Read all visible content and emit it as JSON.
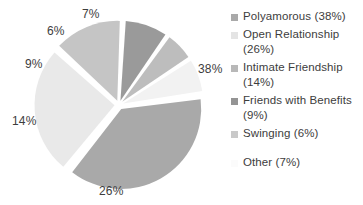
{
  "chart_data": {
    "type": "pie",
    "title": "",
    "subtitle": "",
    "xlabel": "",
    "ylabel": "",
    "legend_position": "right",
    "grid": false,
    "categories": [
      "Polyamorous",
      "Open Relationship",
      "Intimate Friendship",
      "Friends with Benefits",
      "Swinging",
      "Other"
    ],
    "values": [
      38,
      26,
      14,
      9,
      6,
      7
    ],
    "value_unit": "%",
    "slice_labels": [
      "38%",
      "26%",
      "14%",
      "9%",
      "6%",
      "7%"
    ],
    "slice_colors": [
      "#a9a9a9",
      "#e9e9e9",
      "#c5c5c5",
      "#9a9a9a",
      "#bdbdbd",
      "#f2f2f2"
    ],
    "exploded": true,
    "start_angle_deg": -8,
    "legend_entries": [
      "Polyamorous (38%)",
      "Open Relationship (26%)",
      "Intimate Friendship (14%)",
      "Friends with Benefits (9%)",
      "Swinging (6%)",
      "Other (7%)"
    ]
  },
  "pie": {
    "labels": [
      {
        "text": "38%",
        "left": 198,
        "top": 62
      },
      {
        "text": "26%",
        "left": 99,
        "top": 184
      },
      {
        "text": "14%",
        "left": 12,
        "top": 114
      },
      {
        "text": "9%",
        "left": 25,
        "top": 57
      },
      {
        "text": "6%",
        "left": 47,
        "top": 24
      },
      {
        "text": "7%",
        "left": 82,
        "top": 7
      }
    ]
  },
  "legend": {
    "items": [
      {
        "label": "Polyamorous (38%)",
        "color": "#a9a9a9"
      },
      {
        "label": "Open Relationship (26%)",
        "color": "#e4e4e4"
      },
      {
        "label": "Intimate Friendship (14%)",
        "color": "#b8b8b8"
      },
      {
        "label": "Friends with Benefits (9%)",
        "color": "#949494"
      },
      {
        "label": "Swinging (6%)",
        "color": "#c9c9c9"
      },
      {
        "label": "Other (7%)",
        "color": "#fbfbfb"
      }
    ]
  },
  "colors": {
    "background": "#ffffff",
    "text": "#3d3d3d",
    "slice_gap": "#ffffff"
  }
}
